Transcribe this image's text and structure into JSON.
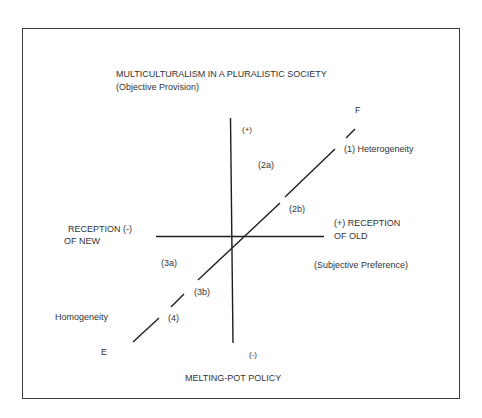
{
  "diagram": {
    "top_title": "MULTICULTURALISM IN A PLURALISTIC SOCIETY",
    "top_subtitle": "(Objective Provision)",
    "bottom_title": "MELTING-POT POLICY",
    "left_axis_label_line1": "RECEPTION (-)",
    "left_axis_label_line2": "OF NEW",
    "right_axis_label_line1": "(+) RECEPTION",
    "right_axis_label_line2": "OF OLD",
    "right_subtitle": "(Subjective Preference)",
    "vertical_top_sign": "(+)",
    "vertical_bottom_sign": "(-)",
    "diagonal_top_end": "F",
    "diagonal_bottom_end": "E",
    "regions": {
      "r1": "(1) Heterogeneity",
      "r2a": "(2a)",
      "r2b": "(2b)",
      "r3a": "(3a)",
      "r3b": "(3b)",
      "r4": "(4)"
    },
    "homogeneity_label": "Homogeneity"
  }
}
